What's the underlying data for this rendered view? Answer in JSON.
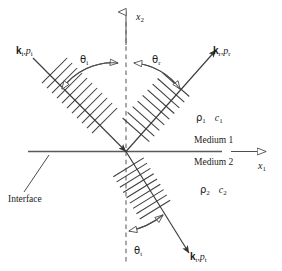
{
  "figure": {
    "type": "physics-ray-diagram",
    "background_color": "#ffffff",
    "line_color": "#4d4d4d",
    "text_color": "#1a1a1a"
  },
  "axes": {
    "vertical": {
      "symbol": "x",
      "subscript": "2",
      "name": "x2-axis",
      "direction": "up",
      "arrowhead": "hollow"
    },
    "horizontal": {
      "symbol": "x",
      "subscript": "1",
      "name": "x1-axis",
      "direction": "right",
      "arrowhead": "hollow"
    }
  },
  "normal_line": {
    "style": "dashed",
    "orientation": "vertical",
    "name": "normal-line"
  },
  "interface": {
    "label": "Interface",
    "style": "solid-horizontal"
  },
  "media": {
    "upper": {
      "name_label": "Medium 1",
      "density_symbol": "ρ",
      "density_subscript": "1",
      "speed_symbol": "c",
      "speed_subscript": "1"
    },
    "lower": {
      "name_label": "Medium 2",
      "density_symbol": "ρ",
      "density_subscript": "2",
      "speed_symbol": "c",
      "speed_subscript": "2"
    }
  },
  "rays": {
    "incident": {
      "wavevector_symbol": "k",
      "wavevector_subscript": "i",
      "separator": ",",
      "pressure_symbol": "p",
      "pressure_subscript": "i",
      "angle_symbol": "θ",
      "angle_subscript": "i",
      "hatch_count": 11,
      "arrowhead": "solid",
      "direction": "toward-origin"
    },
    "reflected": {
      "wavevector_symbol": "k",
      "wavevector_subscript": "r",
      "separator": ",",
      "pressure_symbol": "p",
      "pressure_subscript": "r",
      "angle_symbol": "θ",
      "angle_subscript": "r",
      "hatch_count": 9,
      "arrowhead": "solid",
      "direction": "away-from-origin"
    },
    "transmitted": {
      "wavevector_symbol": "k",
      "wavevector_subscript": "t",
      "separator": ",",
      "pressure_symbol": "p",
      "pressure_subscript": "t",
      "angle_symbol": "θ",
      "angle_subscript": "t",
      "hatch_count": 9,
      "arrowhead": "solid",
      "direction": "away-from-origin"
    }
  }
}
